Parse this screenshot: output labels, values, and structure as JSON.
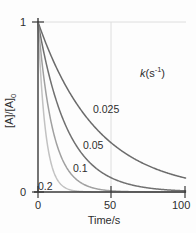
{
  "figure": {
    "background_color": "#fdfdfd",
    "axis_color": "#3a3a3a",
    "grid_color": "#d8d8d8"
  },
  "axes": {
    "x": {
      "title": "Time/s",
      "ticks": [
        "0",
        "50",
        "100"
      ],
      "tick_values": [
        0,
        50,
        100
      ],
      "min": 0,
      "max": 100
    },
    "y": {
      "title_parts": {
        "a": "[A]/[A]",
        "sub": "0"
      },
      "title": "[A]/[A]0",
      "ticks": [
        "1",
        "0"
      ],
      "tick_values": [
        1,
        0
      ],
      "min": 0,
      "max": 1
    }
  },
  "legend": {
    "title_var": "k",
    "title_unit_open": "(s",
    "title_unit_sup": "-1",
    "title_unit_close": ")",
    "title": "k(s-1)"
  },
  "series_labels": [
    {
      "text": "0.025",
      "left": 93,
      "top": 104
    },
    {
      "text": "0.05",
      "left": 83,
      "top": 140
    },
    {
      "text": "0.1",
      "left": 73,
      "top": 163
    },
    {
      "text": "0.2",
      "left": 38,
      "top": 181
    }
  ],
  "chart_data": {
    "type": "line",
    "title": "",
    "subtitle": "",
    "xlabel": "Time/s",
    "ylabel": "[A]/[A]0",
    "xlim": [
      0,
      100
    ],
    "ylim": [
      0,
      1
    ],
    "xticks": [
      0,
      50,
      100
    ],
    "yticks": [
      0,
      1
    ],
    "grid": "gridline at y=1 and x=50",
    "legend_position": "upper-right-inside",
    "legend_title": "k(s-1)",
    "model": "[A]/[A]0 = exp(-k*t)",
    "x": [
      0,
      5,
      10,
      15,
      20,
      25,
      30,
      35,
      40,
      45,
      50,
      55,
      60,
      65,
      70,
      75,
      80,
      85,
      90,
      95,
      100
    ],
    "series": [
      {
        "name": "0.025",
        "k": 0.025,
        "color": "#6b6b6b",
        "values": [
          1.0,
          0.882,
          0.779,
          0.687,
          0.607,
          0.535,
          0.472,
          0.417,
          0.368,
          0.325,
          0.287,
          0.253,
          0.223,
          0.197,
          0.174,
          0.153,
          0.135,
          0.119,
          0.105,
          0.093,
          0.082
        ]
      },
      {
        "name": "0.05",
        "k": 0.05,
        "color": "#707070",
        "values": [
          1.0,
          0.779,
          0.607,
          0.472,
          0.368,
          0.287,
          0.223,
          0.174,
          0.135,
          0.105,
          0.082,
          0.064,
          0.05,
          0.039,
          0.03,
          0.024,
          0.018,
          0.014,
          0.011,
          0.009,
          0.007
        ]
      },
      {
        "name": "0.1",
        "k": 0.1,
        "color": "#a0a0a0",
        "values": [
          1.0,
          0.607,
          0.368,
          0.223,
          0.135,
          0.082,
          0.05,
          0.03,
          0.018,
          0.011,
          0.007,
          0.004,
          0.002,
          0.0015,
          0.0009,
          0.0006,
          0.0003,
          0.0002,
          0.0001,
          0.0001,
          0.0
        ]
      },
      {
        "name": "0.2",
        "k": 0.2,
        "color": "#c2c2c2",
        "values": [
          1.0,
          0.368,
          0.135,
          0.05,
          0.018,
          0.007,
          0.002,
          0.0009,
          0.0003,
          0.0001,
          0.0,
          0.0,
          0.0,
          0.0,
          0.0,
          0.0,
          0.0,
          0.0,
          0.0,
          0.0,
          0.0
        ]
      }
    ]
  }
}
